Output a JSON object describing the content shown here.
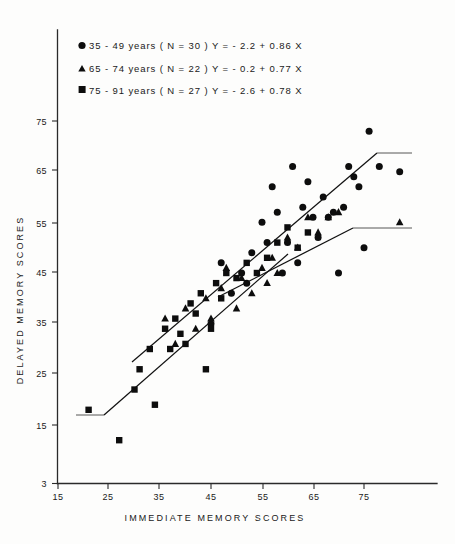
{
  "figure": {
    "background_color": "#fdfdfc",
    "ink_color": "#0d0d0d"
  },
  "legend": {
    "position": "top-left",
    "entries": [
      {
        "marker": "circle-marker",
        "group": "35 - 49",
        "unit": "years",
        "n_text": "( N  =  30 )",
        "equation": "Y =  - 2.2  + 0.86 X",
        "full_text": "35 - 49  years   ( N  =  30 )  Y =  - 2.2  + 0.86 X"
      },
      {
        "marker": "triangle-marker",
        "group": "65 - 74",
        "unit": "years",
        "n_text": "( N  =  22 )",
        "equation": "Y =  - 0.2  + 0.77 X",
        "full_text": "65 - 74  years   ( N  =  22 )  Y =  - 0.2  + 0.77 X"
      },
      {
        "marker": "square-marker",
        "group": "75 - 91",
        "unit": "years",
        "n_text": "( N  =  27 )",
        "equation": "Y =  - 2.6  + 0.78 X",
        "full_text": "75 - 91  years   ( N  =  27 )  Y =  - 2.6  + 0.78 X"
      }
    ]
  },
  "chart_data": {
    "type": "scatter",
    "title": "",
    "xlabel": "IMMEDIATE  MEMORY  SCORES",
    "ylabel": "DELAYED  MEMORY  SCORES",
    "xlim": [
      13,
      85
    ],
    "ylim": [
      3,
      80
    ],
    "grid": false,
    "xticks": [
      15,
      25,
      35,
      45,
      55,
      65,
      75
    ],
    "xtick_labels": [
      "15",
      "25",
      "35",
      "45",
      "55",
      "65",
      "75"
    ],
    "yticks": [
      3,
      15,
      25,
      35,
      45,
      55,
      65,
      75
    ],
    "ytick_labels": [
      "3",
      "15",
      "25",
      "35",
      "45",
      "55",
      "65",
      "75"
    ],
    "legend_position": "top-left outside axes",
    "series": [
      {
        "name": "35 - 49 years",
        "marker": "circle",
        "n": 30,
        "regression": {
          "intercept": -2.2,
          "slope": 0.86,
          "x_start": 30,
          "x_end": 78,
          "label_side": "right"
        },
        "points": [
          [
            47,
            47
          ],
          [
            45,
            35
          ],
          [
            49,
            41
          ],
          [
            51,
            45
          ],
          [
            52,
            43
          ],
          [
            53,
            49
          ],
          [
            55,
            55
          ],
          [
            56,
            51
          ],
          [
            57,
            62
          ],
          [
            58,
            57
          ],
          [
            59,
            45
          ],
          [
            60,
            51
          ],
          [
            61,
            66
          ],
          [
            62,
            47
          ],
          [
            63,
            58
          ],
          [
            64,
            63
          ],
          [
            65,
            56
          ],
          [
            66,
            52
          ],
          [
            67,
            60
          ],
          [
            68,
            56
          ],
          [
            69,
            57
          ],
          [
            70,
            45
          ],
          [
            71,
            58
          ],
          [
            72,
            66
          ],
          [
            73,
            64
          ],
          [
            74,
            62
          ],
          [
            75,
            50
          ],
          [
            76,
            73
          ],
          [
            78,
            66
          ],
          [
            82,
            65
          ]
        ]
      },
      {
        "name": "65 - 74 years",
        "marker": "triangle",
        "n": 22,
        "regression": {
          "intercept": -0.2,
          "slope": 0.77,
          "x_start": 46,
          "x_end": 73,
          "label_side": "right"
        },
        "points": [
          [
            36,
            36
          ],
          [
            38,
            31
          ],
          [
            40,
            38
          ],
          [
            42,
            34
          ],
          [
            44,
            40
          ],
          [
            45,
            36
          ],
          [
            47,
            42
          ],
          [
            48,
            46
          ],
          [
            50,
            38
          ],
          [
            51,
            44
          ],
          [
            53,
            41
          ],
          [
            55,
            46
          ],
          [
            56,
            43
          ],
          [
            57,
            48
          ],
          [
            58,
            45
          ],
          [
            60,
            52
          ],
          [
            62,
            50
          ],
          [
            64,
            56
          ],
          [
            66,
            53
          ],
          [
            68,
            56
          ],
          [
            70,
            57
          ],
          [
            82,
            55
          ]
        ]
      },
      {
        "name": "75 - 91 years",
        "marker": "square",
        "n": 27,
        "regression": {
          "intercept": -2.6,
          "slope": 0.78,
          "x_start": 24,
          "x_end": 60,
          "label_side": "left"
        },
        "points": [
          [
            21,
            18
          ],
          [
            27,
            12
          ],
          [
            30,
            22
          ],
          [
            31,
            26
          ],
          [
            33,
            30
          ],
          [
            34,
            19
          ],
          [
            36,
            34
          ],
          [
            37,
            30
          ],
          [
            38,
            36
          ],
          [
            39,
            33
          ],
          [
            40,
            31
          ],
          [
            41,
            39
          ],
          [
            42,
            37
          ],
          [
            43,
            41
          ],
          [
            44,
            26
          ],
          [
            45,
            34
          ],
          [
            46,
            43
          ],
          [
            47,
            40
          ],
          [
            48,
            45
          ],
          [
            50,
            44
          ],
          [
            52,
            47
          ],
          [
            54,
            45
          ],
          [
            56,
            48
          ],
          [
            58,
            51
          ],
          [
            60,
            54
          ],
          [
            62,
            50
          ],
          [
            64,
            53
          ]
        ]
      }
    ]
  }
}
